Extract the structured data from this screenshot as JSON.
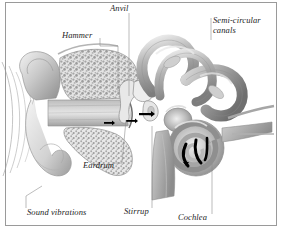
{
  "figure": {
    "border_color": "#9a9a9a",
    "background_color": "#ffffff",
    "text_color": "#1d1d1d",
    "arrow_color": "#000000",
    "labels": {
      "anvil": "Anvil",
      "hammer": "Hammer",
      "semicircular_line1": "Semi-circular",
      "semicircular_line2": "canals",
      "eardrum": "Eardrum",
      "sound_vibrations": "Sound vibrations",
      "stirrup": "Stirrup",
      "cochlea": "Cochlea"
    }
  }
}
